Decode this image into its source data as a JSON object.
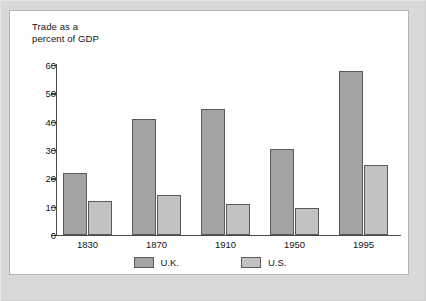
{
  "figure": {
    "background_color": "#d9d9d9",
    "panel_color": "#ffffff",
    "panel_border_color": "#b4b4b4"
  },
  "chart_data": {
    "type": "bar",
    "title": "Trade as a\npercent of GDP",
    "xlabel": "",
    "ylabel": "",
    "ylim": [
      0,
      60
    ],
    "yticks": [
      0,
      10,
      20,
      30,
      40,
      50,
      60
    ],
    "ytick_labels": [
      "0",
      "10",
      "20",
      "30",
      "40",
      "50",
      "60"
    ],
    "grid": false,
    "legend_position": "bottom",
    "categories": [
      "1830",
      "1870",
      "1910",
      "1950",
      "1995"
    ],
    "series": [
      {
        "name": "U.K.",
        "color": "#a3a3a3",
        "values": [
          22,
          41,
          44.5,
          30.5,
          58
        ]
      },
      {
        "name": "U.S.",
        "color": "#c2c2c2",
        "values": [
          12,
          14,
          11,
          9.5,
          24.7
        ]
      }
    ],
    "bar_edge_color": "#5a5a5a",
    "axis_color": "#4a4a4a"
  }
}
